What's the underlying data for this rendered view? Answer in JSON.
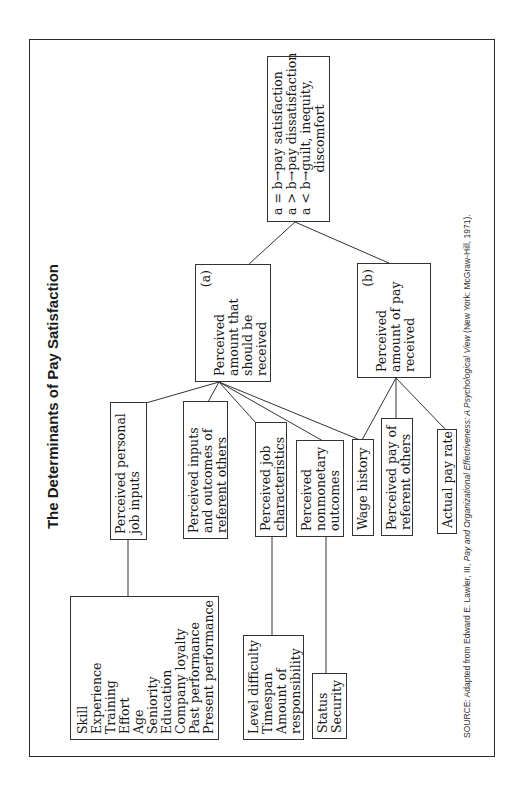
{
  "title": "The Determinants of Pay Satisfaction",
  "result_box": {
    "lines": [
      "a = b→pay satisfaction",
      "a > b→pay dissatisfaction",
      "a < b→guilt, inequity,",
      "discomfort"
    ]
  },
  "node_a": {
    "label": "(a)",
    "lines": [
      "Perceived",
      "amount that",
      "should be",
      "received"
    ]
  },
  "node_b": {
    "label": "(b)",
    "lines": [
      "Perceived",
      "amount of pay",
      "received"
    ]
  },
  "factors": [
    {
      "id": "personal-job-inputs",
      "lines": [
        "Perceived personal",
        "job inputs"
      ]
    },
    {
      "id": "inputs-outcomes-others",
      "lines": [
        "Perceived inputs",
        "and outcomes of",
        "referent others"
      ]
    },
    {
      "id": "job-characteristics",
      "lines": [
        "Perceived job",
        "characteristics"
      ]
    },
    {
      "id": "nonmonetary-outcomes",
      "lines": [
        "Perceived",
        "nonmonetary",
        "outcomes"
      ]
    },
    {
      "id": "wage-history",
      "lines": [
        "Wage history"
      ]
    },
    {
      "id": "pay-of-others",
      "lines": [
        "Perceived pay of",
        "referent others"
      ]
    },
    {
      "id": "actual-pay-rate",
      "lines": [
        "Actual pay rate"
      ]
    }
  ],
  "detail_lists": {
    "personal_inputs": [
      "Skill",
      "Experience",
      "Training",
      "Effort",
      "Age",
      "Seniority",
      "Education",
      "Company loyalty",
      "Past performance",
      "Present performance"
    ],
    "job_characteristics": [
      "Level difficulty",
      "Timespan",
      "Amount of",
      "responsibility"
    ],
    "nonmonetary": [
      "Status",
      "Security"
    ]
  },
  "source": {
    "prefix": "SOURCE: Adapted from Edward E. Lawler, III, ",
    "title": "Pay and Organizational Effectiveness: A Psychological View",
    "suffix": " (New York: McGraw-Hill, 1971)."
  }
}
